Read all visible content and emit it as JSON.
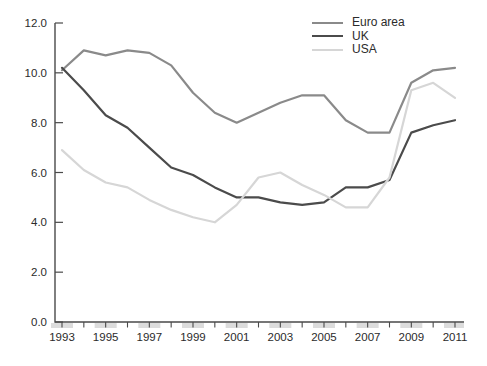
{
  "chart_data": {
    "type": "line",
    "title": "",
    "xlabel": "",
    "ylabel": "",
    "grid": false,
    "x_years": [
      1993,
      1994,
      1995,
      1996,
      1997,
      1998,
      1999,
      2000,
      2001,
      2002,
      2003,
      2004,
      2005,
      2006,
      2007,
      2008,
      2009,
      2010,
      2011
    ],
    "series": [
      {
        "name": "Euro area",
        "color": "#8a8a8a",
        "values": [
          10.1,
          10.9,
          10.7,
          10.9,
          10.8,
          10.3,
          9.2,
          8.4,
          8.0,
          8.4,
          8.8,
          9.1,
          9.1,
          8.1,
          7.6,
          7.6,
          9.6,
          10.1,
          10.2
        ]
      },
      {
        "name": "UK",
        "color": "#4b4b4b",
        "values": [
          10.2,
          9.3,
          8.3,
          7.8,
          7.0,
          6.2,
          5.9,
          5.4,
          5.0,
          5.0,
          4.8,
          4.7,
          4.8,
          5.4,
          5.4,
          5.7,
          7.6,
          7.9,
          8.1
        ]
      },
      {
        "name": "USA",
        "color": "#d6d6d6",
        "values": [
          6.9,
          6.1,
          5.6,
          5.4,
          4.9,
          4.5,
          4.2,
          4.0,
          4.7,
          5.8,
          6.0,
          5.5,
          5.1,
          4.6,
          4.6,
          5.8,
          9.3,
          9.6,
          9.0
        ]
      }
    ],
    "ylim": [
      0,
      12
    ],
    "yticks": [
      0,
      2,
      4,
      6,
      8,
      10,
      12
    ],
    "ytick_labels": [
      "0.0",
      "2.0",
      "4.0",
      "6.0",
      "8.0",
      "10.0",
      "12.0"
    ],
    "xtick_label_years": [
      1993,
      1995,
      1997,
      1999,
      2001,
      2003,
      2005,
      2007,
      2009,
      2011
    ],
    "legend_position": "top-right",
    "colors": {
      "axis": "#4a4a4a",
      "text": "#2b2b2b",
      "tick_band": "#dcdcdc",
      "background": "#ffffff"
    }
  }
}
